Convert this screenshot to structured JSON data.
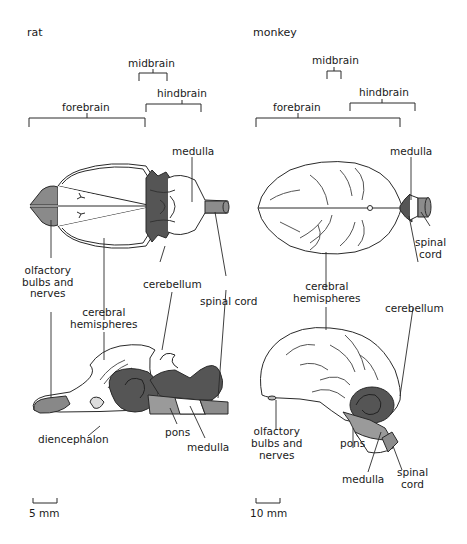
{
  "figure": {
    "panels": [
      {
        "species": "rat",
        "regions": {
          "midbrain": "midbrain",
          "hindbrain": "hindbrain",
          "forebrain": "forebrain"
        },
        "labels": {
          "medulla_top": "medulla",
          "olfactory": "olfactory\nbulbs and\nnerves",
          "cerebral": "cerebral\nhemispheres",
          "cerebellum": "cerebellum",
          "spinal_cord": "spinal cord",
          "diencephalon": "diencephalon",
          "pons": "pons",
          "medulla_bottom": "medulla"
        },
        "scale_bar": "5 mm"
      },
      {
        "species": "monkey",
        "regions": {
          "midbrain": "midbrain",
          "hindbrain": "hindbrain",
          "forebrain": "forebrain"
        },
        "labels": {
          "medulla_top": "medulla",
          "spinal_cord_top": "spinal\ncord",
          "cerebral": "cerebral\nhemispheres",
          "cerebellum": "cerebellum",
          "olfactory": "olfactory\nbulbs and\nnerves",
          "pons": "pons",
          "medulla_bottom": "medulla",
          "spinal_cord_bottom": "spinal\ncord"
        },
        "scale_bar": "10 mm"
      }
    ],
    "colors": {
      "outline": "#2a2a2a",
      "olfactory_fill": "#8a8a8a",
      "hindbrain_dark": "#555555",
      "pons_fill": "#9a9a9a",
      "spinal_fill": "#8c8c8c",
      "white": "#ffffff"
    }
  }
}
